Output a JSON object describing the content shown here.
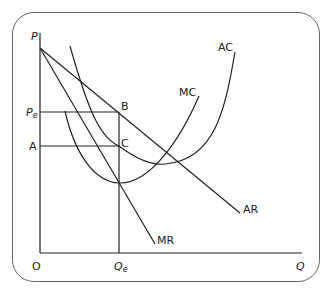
{
  "diagram": {
    "type": "monopoly cost and revenue diagram",
    "axes": {
      "y_label": "P",
      "x_label": "Q",
      "origin_label": "O"
    },
    "price_labels": {
      "pe": "P",
      "pe_sub": "e",
      "a": "A"
    },
    "quantity_labels": {
      "qe": "Q",
      "qe_sub": "e"
    },
    "points": {
      "b": "B",
      "c": "C"
    },
    "curves": {
      "ac": "AC",
      "mc": "MC",
      "ar": "AR",
      "mr": "MR"
    },
    "line_color": "#222222",
    "frame_color": "#666666"
  }
}
